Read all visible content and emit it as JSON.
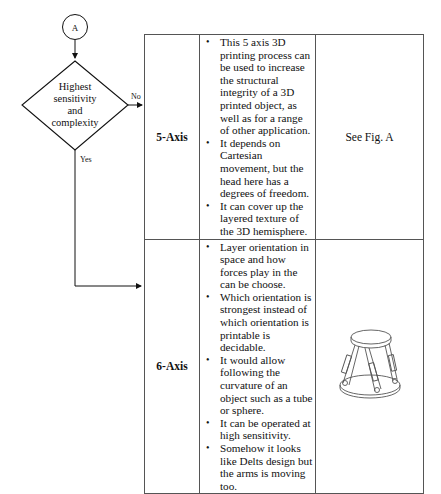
{
  "flowchart": {
    "connector_label": "A",
    "decision_text": [
      "Highest",
      "sensitivity",
      "and",
      "complexity"
    ],
    "no_label": "No",
    "yes_label": "Yes"
  },
  "table": {
    "rows": [
      {
        "name": "5-Axis",
        "bullets": [
          "This 5 axis 3D printing process can be used to increase the structural integrity of a 3D printed object, as well as for a range of other application.",
          "It depends on Cartesian movement, but the head here has a degrees of freedom.",
          "It can cover up the layered texture of the 3D hemisphere."
        ],
        "figure": "See Fig. A"
      },
      {
        "name": "6-Axis",
        "bullets": [
          "Layer orientation in space and how forces play in the can be choose.",
          "Which orientation is strongest instead of which orientation is printable is decidable.",
          "It would allow following the curvature of an object such as a tube or sphere.",
          "It can be operated at high sensitivity.",
          "Somehow it looks like Delts design but the arms is moving too."
        ],
        "figure": "hexapod-6-axis-illustration"
      }
    ]
  }
}
